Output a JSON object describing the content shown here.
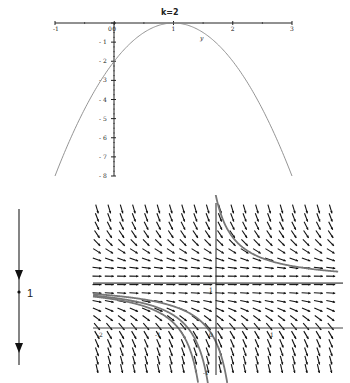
{
  "chart_data": [
    {
      "type": "line",
      "title": "k=2",
      "xlabel": "",
      "ylabel": "",
      "curve_label": "y",
      "function": "y = -2(x-1)^2",
      "x_ticks": [
        "-1",
        "0",
        "1",
        "2",
        "3"
      ],
      "y_ticks": [
        "0",
        "-1",
        "-2",
        "-3",
        "-4",
        "-5",
        "-6",
        "-7",
        "-8"
      ],
      "xlim": [
        -1,
        3
      ],
      "ylim": [
        -8,
        0
      ],
      "grid": false,
      "x": [
        -1,
        -0.5,
        0,
        0.5,
        1,
        1.5,
        2,
        2.5,
        3
      ],
      "series": [
        {
          "name": "y",
          "values": [
            -8,
            -4.5,
            -2,
            -0.5,
            0,
            -0.5,
            -2,
            -4.5,
            -8
          ]
        }
      ]
    },
    {
      "type": "diagram",
      "title": "Phase line",
      "equilibrium": 1,
      "equilibrium_label": "1",
      "arrows": [
        "down above 1",
        "down below 1"
      ],
      "classification": "semi-stable (node)"
    },
    {
      "type": "slope_field",
      "title": "",
      "equation": "dy/dt = -(y-1)^2",
      "xlim": [
        -2,
        3
      ],
      "ylim": [
        -1,
        3
      ],
      "x_ticks": [
        "-2",
        "-1",
        "0",
        "1",
        "2"
      ],
      "y_ticks": [
        "-1",
        "1",
        "2"
      ],
      "equilibrium_line": 1,
      "grid": false,
      "solution_curves": [
        {
          "name": "above-equilibrium",
          "description": "decreasing from top toward y=1 asymptotically"
        },
        {
          "name": "equilibrium",
          "y": 1
        },
        {
          "name": "below-equilibrium-1",
          "description": "starts near y=1 on left, falls to -infinity"
        },
        {
          "name": "below-equilibrium-2",
          "description": "starts near y=1 on left, falls to -infinity"
        },
        {
          "name": "below-equilibrium-3",
          "description": "starts near y=1 on left, falls to -infinity"
        }
      ]
    }
  ],
  "parabola": {
    "title": "k=2",
    "curve_label": "y",
    "x_tick_labels": [
      "-1",
      "0",
      "1",
      "2",
      "3"
    ],
    "y_tick_labels": [
      "0",
      "-1",
      "-2",
      "-3",
      "-4",
      "-5",
      "-6",
      "-7",
      "-8"
    ]
  },
  "phase_line": {
    "equilibrium_label": "1"
  },
  "slope_field": {
    "x_tick_labels": [
      "-2",
      "-1",
      "0",
      "1"
    ],
    "y_tick_labels": [
      "1",
      "-1"
    ]
  },
  "colors": {
    "axis": "#222222",
    "curve": "#888888",
    "arrow": "#111111",
    "solution": "#777777"
  }
}
